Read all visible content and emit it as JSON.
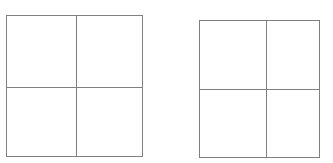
{
  "canvas": {
    "width": 333,
    "height": 163,
    "background": "#ffffff"
  },
  "stroke": {
    "color": "#808080",
    "width": 1.4,
    "style": "solid"
  },
  "figures": [
    {
      "name": "left-quartered-square",
      "label": "Left square divided into four quadrants",
      "x": 6,
      "y": 15,
      "width": 137,
      "height": 142,
      "divider_vertical_x_ratio": 0.5,
      "divider_horizontal_y_ratio": 0.5,
      "quadrants": [
        "top-left",
        "top-right",
        "bottom-left",
        "bottom-right"
      ]
    },
    {
      "name": "right-quartered-square",
      "label": "Right square divided into four quadrants",
      "x": 199,
      "y": 20,
      "width": 121,
      "height": 138,
      "divider_vertical_x_ratio": 0.545,
      "divider_horizontal_y_ratio": 0.493,
      "quadrants": [
        "top-left",
        "top-right",
        "bottom-left",
        "bottom-right"
      ]
    }
  ]
}
